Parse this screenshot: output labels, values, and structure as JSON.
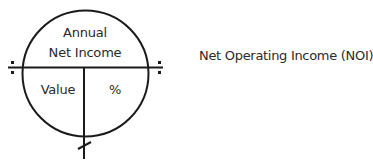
{
  "diagram": {
    "top_section": {
      "line1": "Annual",
      "line2": "Net Income"
    },
    "bottom_left": "Value",
    "bottom_right": "%",
    "operators": {
      "left": "divide-icon",
      "right": "divide-icon",
      "bottom": "multiply-icon"
    },
    "stroke_color": "#1a1a1a"
  },
  "caption": "Net Operating Income (NOI)"
}
